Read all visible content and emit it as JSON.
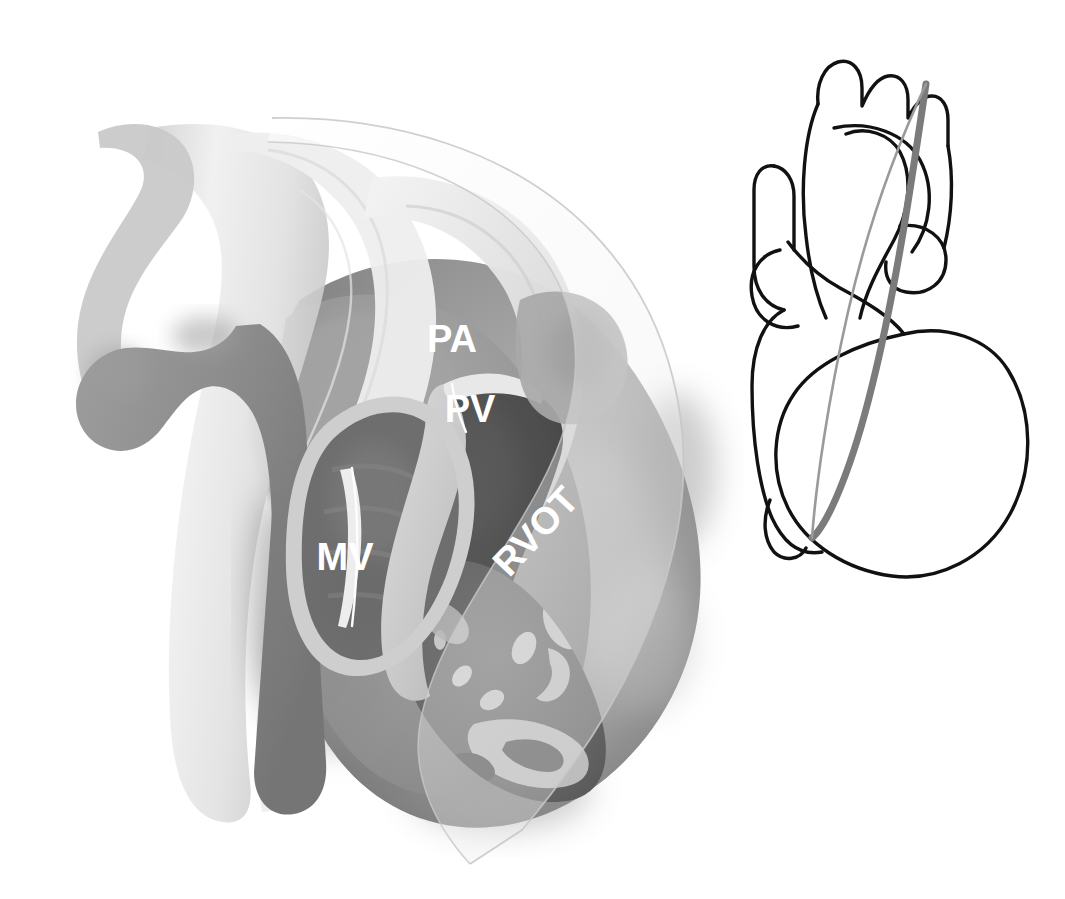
{
  "figure": {
    "background_color": "#ffffff",
    "width": 1065,
    "height": 899
  },
  "main_illustration": {
    "name": "cardiac-cutaway-rvot-view",
    "description": "Grayscale three-dimensional cut-away rendering of the heart seen in the right ventricular outflow tract plane, with aorta, pulmonary trunk, left atrium, mitral valve and trabeculated right ventricle visible.",
    "bounds": {
      "x": 48,
      "y": 112,
      "width": 660,
      "height": 720
    },
    "palette": {
      "vessel_light": "#e3e3e3",
      "vessel_highlight": "#f1f1f1",
      "myocardium_mid": "#9b9b9b",
      "myocardium_dark": "#7d7d7d",
      "endocardium_pale": "#cfcfcf",
      "cavity_dark": "#4d4d4d",
      "cavity_mid": "#6a6a6a",
      "pulmonary_branch": "#8a8a8a",
      "label_text": "#ffffff",
      "leader_line": "#fdfdfd",
      "imaging_plane_tint": "#f2f2f2"
    },
    "labels": [
      {
        "id": "pa",
        "text": "PA",
        "x": 452,
        "y": 352,
        "rotation": 0,
        "font_size": 38,
        "leader": false,
        "meaning": "pulmonary artery"
      },
      {
        "id": "pv",
        "text": "PV",
        "x": 470,
        "y": 422,
        "rotation": 0,
        "font_size": 38,
        "leader": true,
        "meaning": "pulmonary valve"
      },
      {
        "id": "rvot",
        "text": "RVOT",
        "x": 545,
        "y": 540,
        "rotation": -47,
        "font_size": 38,
        "leader": false,
        "meaning": "right ventricular outflow tract"
      },
      {
        "id": "mv",
        "text": "MV",
        "x": 345,
        "y": 570,
        "rotation": 0,
        "font_size": 38,
        "leader": true,
        "meaning": "mitral valve"
      }
    ],
    "imaging_plane_overlay": {
      "name": "echo-sector-plane",
      "tint": "#f2f2f2",
      "opacity": 0.55,
      "edge_color": "#bdbdbd",
      "description": "Translucent pale sector marking the imaging plane; it sweeps from the upper left across the great vessels and tapers to an apex below the cardiac apex."
    }
  },
  "inset_diagram": {
    "name": "heart-orientation-inset",
    "description": "Simplified black line drawing of the whole heart in anterior view with a gray lens-shaped marker indicating the position and angle of the imaging plane.",
    "bounds": {
      "x": 700,
      "y": 35,
      "width": 330,
      "height": 500
    },
    "outline_color": "#111111",
    "plane_marker_color": "#7b7b7b",
    "plane_marker_thin_color": "#9a9a9a",
    "parts": [
      "aortic arch with three brachiocephalic branches",
      "superior vena cava",
      "pulmonary trunk",
      "right atrial appendage",
      "left atrial appendage",
      "right ventricle",
      "left ventricle",
      "inferior vena cava"
    ],
    "plane_marker": {
      "label": "imaging plane",
      "shape": "narrow lens / ellipse sweeping top-right to bottom-left"
    }
  }
}
